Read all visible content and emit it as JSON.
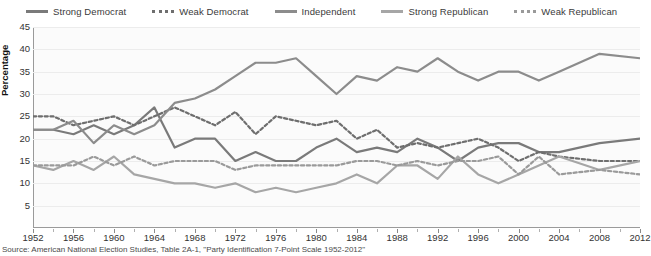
{
  "legend": {
    "position": "top",
    "items": [
      {
        "label": "Strong Democrat",
        "color": "#7a7a7a",
        "style": "solid"
      },
      {
        "label": "Weak Democrat",
        "color": "#6e6e6e",
        "style": "dotted"
      },
      {
        "label": "Independent",
        "color": "#8c8c8c",
        "style": "solid"
      },
      {
        "label": "Strong Republican",
        "color": "#a6a6a6",
        "style": "solid"
      },
      {
        "label": "Weak Republican",
        "color": "#9a9a9a",
        "style": "dotted"
      }
    ]
  },
  "axes": {
    "ylabel": "Percentage",
    "yticks": [
      "45",
      "40",
      "35",
      "30",
      "25",
      "20",
      "15",
      "10",
      "5"
    ],
    "xticks": [
      "1952",
      "1956",
      "1960",
      "1964",
      "1968",
      "1972",
      "1976",
      "1980",
      "1984",
      "1988",
      "1992",
      "1996",
      "2000",
      "2004",
      "2008",
      "2012"
    ]
  },
  "source": "Source: American National Election Studies, Table 2A-1, \"Party Identification 7-Point Scale 1952-2012\"",
  "chart_data": {
    "type": "line",
    "title": "",
    "xlabel": "",
    "ylabel": "Percentage",
    "xlim": [
      1952,
      2012
    ],
    "ylim": [
      0,
      45
    ],
    "grid": true,
    "legend_position": "top",
    "x": [
      1952,
      1954,
      1956,
      1958,
      1960,
      1962,
      1964,
      1966,
      1968,
      1970,
      1972,
      1974,
      1976,
      1978,
      1980,
      1982,
      1984,
      1986,
      1988,
      1990,
      1992,
      1994,
      1996,
      1998,
      2000,
      2002,
      2004,
      2008,
      2012
    ],
    "series": [
      {
        "name": "Strong Democrat",
        "color": "#7a7a7a",
        "style": "solid",
        "values": [
          22,
          22,
          21,
          23,
          21,
          23,
          27,
          18,
          20,
          20,
          15,
          17,
          15,
          15,
          18,
          20,
          17,
          18,
          17,
          20,
          18,
          15,
          18,
          19,
          19,
          17,
          17,
          19,
          20
        ]
      },
      {
        "name": "Weak Democrat",
        "color": "#6e6e6e",
        "style": "dotted",
        "values": [
          25,
          25,
          23,
          24,
          25,
          23,
          25,
          27,
          25,
          23,
          26,
          21,
          25,
          24,
          23,
          24,
          20,
          22,
          18,
          19,
          18,
          19,
          20,
          18,
          15,
          17,
          16,
          15,
          15
        ]
      },
      {
        "name": "Independent",
        "color": "#8c8c8c",
        "style": "solid",
        "values": [
          22,
          22,
          24,
          19,
          23,
          21,
          23,
          28,
          29,
          31,
          34,
          37,
          37,
          38,
          34,
          30,
          34,
          33,
          36,
          35,
          38,
          35,
          33,
          35,
          35,
          33,
          35,
          39,
          38
        ]
      },
      {
        "name": "Strong Republican",
        "color": "#a6a6a6",
        "style": "solid",
        "values": [
          14,
          13,
          15,
          13,
          16,
          12,
          11,
          10,
          10,
          9,
          10,
          8,
          9,
          8,
          9,
          10,
          12,
          10,
          14,
          14,
          11,
          16,
          12,
          10,
          12,
          14,
          16,
          13,
          15
        ]
      },
      {
        "name": "Weak Republican",
        "color": "#9a9a9a",
        "style": "dotted",
        "values": [
          14,
          14,
          14,
          16,
          14,
          16,
          14,
          15,
          15,
          15,
          13,
          14,
          14,
          14,
          14,
          14,
          15,
          15,
          14,
          15,
          14,
          15,
          15,
          16,
          12,
          16,
          12,
          13,
          12
        ]
      }
    ]
  }
}
